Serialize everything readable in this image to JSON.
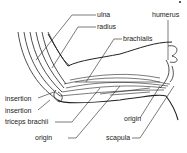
{
  "diagram": {
    "labels": {
      "ulna": "ulna",
      "radius": "radius",
      "humerus": "humerus",
      "brachialis": "brachialis",
      "insertion_1": "insertion",
      "insertion_2": "insertion",
      "triceps": "triceps brachii",
      "origin_left": "origin",
      "origin_right": "origin",
      "scapula": "scapula"
    },
    "colors": {
      "line": "#222222",
      "background": "#ffffff"
    }
  }
}
